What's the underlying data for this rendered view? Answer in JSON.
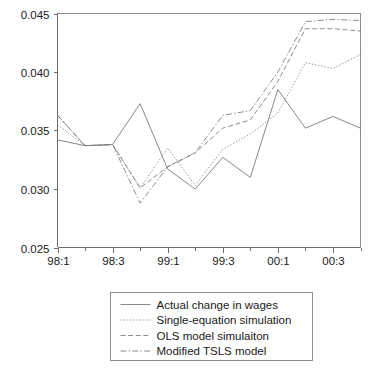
{
  "chart_data": {
    "type": "line",
    "title": "",
    "xlabel": "",
    "ylabel": "",
    "ylim": [
      0.025,
      0.045
    ],
    "yticks": [
      0.025,
      0.03,
      0.035,
      0.04,
      0.045
    ],
    "ytick_labels": [
      "0.025",
      "0.030",
      "0.035",
      "0.040",
      "0.045"
    ],
    "x": [
      "98:1",
      "98:2",
      "98:3",
      "98:4",
      "99:1",
      "99:2",
      "99:3",
      "99:4",
      "00:1",
      "00:2",
      "00:3",
      "00:4"
    ],
    "xtick_labels": [
      "98:1",
      "98:3",
      "99:1",
      "99:3",
      "00:1",
      "00:3"
    ],
    "xtick_positions": [
      0,
      2,
      4,
      6,
      8,
      10
    ],
    "grid": false,
    "legend_position": "below-center",
    "series": [
      {
        "name": "Actual change in wages",
        "style": "solid",
        "color": "#7a7a7a",
        "values": [
          0.0342,
          0.0337,
          0.0338,
          0.0373,
          0.0317,
          0.03,
          0.0327,
          0.031,
          0.0385,
          0.0352,
          0.0362,
          0.0352
        ]
      },
      {
        "name": "Single-equation simulation",
        "style": "dotted",
        "color": "#8a8a8a",
        "values": [
          0.0355,
          0.0337,
          0.0338,
          0.0301,
          0.0335,
          0.0303,
          0.0334,
          0.0347,
          0.0365,
          0.0408,
          0.0403,
          0.0415
        ]
      },
      {
        "name": "OLS model simulaiton",
        "style": "dashed",
        "color": "#7f7f7f",
        "values": [
          0.0363,
          0.0337,
          0.0338,
          0.0301,
          0.0319,
          0.0331,
          0.0352,
          0.0359,
          0.0392,
          0.0437,
          0.0437,
          0.0435
        ]
      },
      {
        "name": "Modified TSLS model",
        "style": "dashdot",
        "color": "#808080",
        "values": [
          0.0363,
          0.0337,
          0.0338,
          0.0288,
          0.0319,
          0.0331,
          0.0363,
          0.0367,
          0.04,
          0.0443,
          0.0445,
          0.0444
        ]
      }
    ]
  },
  "legend": {
    "items": [
      {
        "label": "Actual change in wages",
        "style": "solid"
      },
      {
        "label": "Single-equation simulation",
        "style": "dotted"
      },
      {
        "label": "OLS model simulaiton",
        "style": "dashed"
      },
      {
        "label": "Modified TSLS model",
        "style": "dashdot"
      }
    ]
  }
}
